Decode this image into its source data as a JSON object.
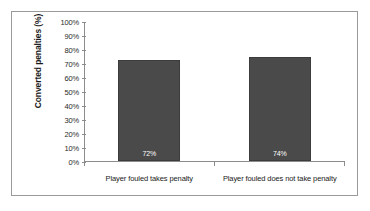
{
  "chart_data": {
    "type": "bar",
    "title": "",
    "xlabel": "",
    "ylabel": "Converted penalties (%)",
    "categories": [
      "Player fouled takes penalty",
      "Player fouled does not take penalty"
    ],
    "values": [
      72,
      74
    ],
    "value_labels": [
      "72%",
      "74%"
    ],
    "ylim": [
      0,
      100
    ],
    "ytick_labels": [
      "0%",
      "10%",
      "20%",
      "30%",
      "40%",
      "50%",
      "60%",
      "70%",
      "80%",
      "90%",
      "100%"
    ],
    "ytick_values": [
      0,
      10,
      20,
      30,
      40,
      50,
      60,
      70,
      80,
      90,
      100
    ],
    "grid": false,
    "legend": false,
    "bar_color": "#4a4a4a",
    "axis_color": "#8c8c8c",
    "border_color": "#9a9a9a",
    "value_label_color": "#ffffff"
  }
}
